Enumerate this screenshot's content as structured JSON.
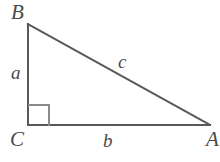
{
  "figure": {
    "type": "geometry-diagram",
    "shape": "right-triangle",
    "background_color": "#ffffff",
    "stroke_color": "#595959",
    "label_color": "#4a4a4a",
    "stroke_width": 2,
    "width": 220,
    "height": 162
  },
  "vertices": {
    "B": {
      "label": "B",
      "x": 28,
      "y": 24
    },
    "C": {
      "label": "C",
      "x": 28,
      "y": 125
    },
    "A": {
      "label": "A",
      "x": 210,
      "y": 125
    }
  },
  "sides": {
    "a": {
      "label": "a",
      "from": "B",
      "to": "C",
      "description": "vertical leg"
    },
    "b": {
      "label": "b",
      "from": "C",
      "to": "A",
      "description": "horizontal leg"
    },
    "c": {
      "label": "c",
      "from": "B",
      "to": "A",
      "description": "hypotenuse"
    }
  },
  "right_angle": {
    "at_vertex": "C",
    "marker": "square",
    "size": 20
  },
  "chart_data": {
    "type": "diagram",
    "title": "",
    "categories": [
      "a",
      "b",
      "c"
    ],
    "values": [
      101,
      182,
      208
    ],
    "xlabel": "",
    "ylabel": "",
    "annotations": [
      "B",
      "C",
      "A",
      "a",
      "b",
      "c"
    ]
  }
}
